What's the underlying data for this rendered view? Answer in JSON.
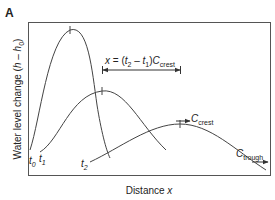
{
  "panel_label": "A",
  "y_axis": {
    "label_prefix": "Water level change (",
    "var_h": "h",
    "minus": " – ",
    "var_h0": "h",
    "sub0": "0",
    "suffix": ")"
  },
  "x_axis": {
    "label_prefix": "Distance ",
    "var": "x"
  },
  "curves": [
    {
      "name": "t0",
      "label": "t",
      "sub": "0"
    },
    {
      "name": "t1",
      "label": "t",
      "sub": "1"
    },
    {
      "name": "t2",
      "label": "t",
      "sub": "2"
    }
  ],
  "annotation": {
    "x": "x",
    "eq": " = (",
    "t2": "t",
    "t2sub": "2",
    "minus": " – ",
    "t1": "t",
    "t1sub": "1",
    "close": ")",
    "C": "C",
    "Csub": "crest"
  },
  "arrows": {
    "crest": {
      "label": "C",
      "sub": "crest"
    },
    "trough": {
      "label": "C",
      "sub": "trough"
    }
  },
  "colors": {
    "line": "#444444",
    "frame": "#555555",
    "text": "#222222"
  }
}
